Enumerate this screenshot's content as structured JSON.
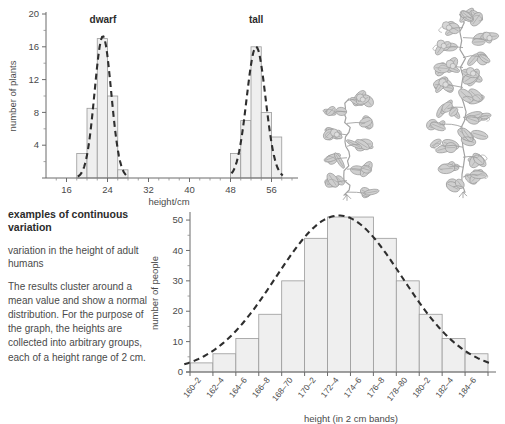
{
  "chart_data": [
    {
      "id": "plant-height-chart",
      "type": "bar",
      "title": "",
      "xlabel": "height/cm",
      "ylabel": "number of plants",
      "xlim": [
        12,
        60
      ],
      "ylim": [
        0,
        20
      ],
      "xticks": [
        16,
        24,
        32,
        40,
        48,
        56
      ],
      "yticks": [
        4,
        8,
        12,
        16,
        20
      ],
      "grid": false,
      "series_labels": [
        "dwarf",
        "tall"
      ],
      "bins": [
        {
          "group": "dwarf",
          "x_start": 18,
          "x_end": 20,
          "value": 3
        },
        {
          "group": "dwarf",
          "x_start": 20,
          "x_end": 22,
          "value": 8.5
        },
        {
          "group": "dwarf",
          "x_start": 22,
          "x_end": 24,
          "value": 17
        },
        {
          "group": "dwarf",
          "x_start": 24,
          "x_end": 26,
          "value": 10
        },
        {
          "group": "dwarf",
          "x_start": 26,
          "x_end": 28,
          "value": 1
        },
        {
          "group": "tall",
          "x_start": 48,
          "x_end": 50,
          "value": 3
        },
        {
          "group": "tall",
          "x_start": 50,
          "x_end": 52,
          "value": 7
        },
        {
          "group": "tall",
          "x_start": 52,
          "x_end": 54,
          "value": 16
        },
        {
          "group": "tall",
          "x_start": 54,
          "x_end": 56,
          "value": 8
        },
        {
          "group": "tall",
          "x_start": 56,
          "x_end": 58,
          "value": 5
        }
      ],
      "overlay": "two dashed normal curves, one per group"
    },
    {
      "id": "human-height-chart",
      "type": "bar",
      "title": "",
      "xlabel": "height (in 2 cm bands)",
      "ylabel": "number of people",
      "ylim": [
        0,
        52
      ],
      "yticks": [
        0,
        10,
        20,
        30,
        40,
        50
      ],
      "grid": false,
      "categories": [
        "160–2",
        "162–4",
        "164–6",
        "166–8",
        "168–70",
        "170–2",
        "172–4",
        "174–6",
        "176–8",
        "178–80",
        "180–2",
        "182–4",
        "184–6"
      ],
      "values": [
        1,
        3,
        6,
        11,
        19,
        30,
        44,
        51,
        44,
        30,
        19,
        11,
        6,
        3,
        1
      ],
      "values_by_band": [
        {
          "band": "160–2",
          "value": 3
        },
        {
          "band": "162–4",
          "value": 6
        },
        {
          "band": "164–6",
          "value": 11
        },
        {
          "band": "166–8",
          "value": 19
        },
        {
          "band": "168–70",
          "value": 30
        },
        {
          "band": "170–2",
          "value": 44
        },
        {
          "band": "172–4",
          "value": 51
        },
        {
          "band": "174–6",
          "value": 51
        },
        {
          "band": "176–8",
          "value": 44
        },
        {
          "band": "178–80",
          "value": 30
        },
        {
          "band": "180–2",
          "value": 19
        },
        {
          "band": "182–4",
          "value": 11
        },
        {
          "band": "184–6",
          "value": 6
        }
      ],
      "overlay": "dashed normal distribution curve"
    }
  ],
  "top_chart": {
    "ylabel": "number of plants",
    "xlabel": "height/cm",
    "label_dwarf": "dwarf",
    "label_tall": "tall",
    "ytick_labels": [
      "4",
      "8",
      "12",
      "16",
      "20"
    ],
    "xtick_labels": [
      "16",
      "24",
      "32",
      "40",
      "48",
      "56"
    ]
  },
  "bottom_chart": {
    "ylabel": "number of people",
    "xlabel": "height (in 2 cm bands)",
    "ytick_labels": [
      "0",
      "10",
      "20",
      "30",
      "40",
      "50"
    ],
    "xtick_labels": [
      "160–2",
      "162–4",
      "164–6",
      "166–8",
      "168–70",
      "170–2",
      "172–4",
      "174–6",
      "176–8",
      "178–80",
      "180–2",
      "182–4",
      "184–6"
    ]
  },
  "text_block": {
    "heading": "examples of continuous variation",
    "subtitle": "variation in the height of adult humans",
    "body": "The results cluster around a mean value and show a normal distribution. For the purpose of the graph, the heights are collected into arbitrary groups, each of a height range of 2 cm."
  },
  "illustrations": {
    "dwarf_plant": "dwarf-pea-plant-illustration",
    "tall_plant": "tall-pea-plant-illustration"
  },
  "colors": {
    "bar_fill": "#efefef",
    "bar_stroke": "#9a9a9a",
    "axis": "#6b6b6b",
    "curve": "#2e2e2e",
    "text": "#4a4a4a",
    "plant": "#9d9d9d"
  }
}
